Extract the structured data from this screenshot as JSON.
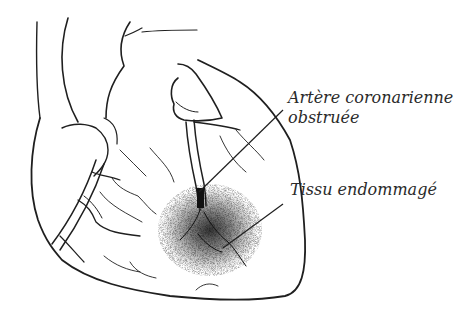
{
  "figure": {
    "labels": {
      "artery_line1": "Artère coronarienne",
      "artery_line2": "obstruée",
      "tissue": "Tissu endommagé"
    },
    "colors": {
      "ink": "#1f1f1f",
      "background": "#ffffff",
      "damage": "#222222"
    }
  }
}
